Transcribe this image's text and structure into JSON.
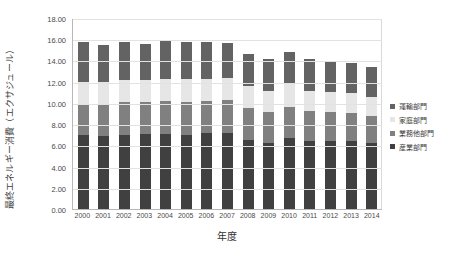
{
  "chart_data": {
    "type": "bar",
    "subtype": "stacked-column",
    "title": "",
    "xlabel": "年度",
    "ylabel": "最終エネルギー消費（エクサジュール）",
    "ylim": [
      0,
      18
    ],
    "ytick_step": 2,
    "grid": true,
    "legend_position": "right",
    "categories": [
      "2000",
      "2001",
      "2002",
      "2003",
      "2004",
      "2005",
      "2006",
      "2007",
      "2008",
      "2009",
      "2010",
      "2011",
      "2012",
      "2013",
      "2014"
    ],
    "ytick_labels": [
      "0.00",
      "2.00",
      "4.00",
      "6.00",
      "8.00",
      "10.00",
      "12.00",
      "14.00",
      "16.00",
      "18.00"
    ],
    "series": [
      {
        "name": "産業部門",
        "color": "#404040",
        "stack_order": 1,
        "values": [
          6.95,
          6.85,
          7.0,
          7.05,
          7.1,
          7.0,
          7.2,
          7.2,
          6.55,
          6.25,
          6.7,
          6.45,
          6.4,
          6.45,
          6.25
        ]
      },
      {
        "name": "業務他部門",
        "color": "#808080",
        "stack_order": 2,
        "values": [
          2.95,
          3.0,
          3.05,
          3.0,
          3.05,
          3.1,
          3.0,
          3.05,
          2.95,
          2.85,
          2.95,
          2.75,
          2.7,
          2.6,
          2.5
        ]
      },
      {
        "name": "家庭部門",
        "color": "#e6e6e6",
        "stack_order": 3,
        "values": [
          2.1,
          2.1,
          2.15,
          2.1,
          2.1,
          2.2,
          2.05,
          2.1,
          2.05,
          2.05,
          2.15,
          1.95,
          1.95,
          1.9,
          1.8
        ]
      },
      {
        "name": "運輸部門",
        "color": "#636363",
        "stack_order": 4,
        "values": [
          3.7,
          3.55,
          3.5,
          3.45,
          3.6,
          3.45,
          3.5,
          3.25,
          3.1,
          3.0,
          3.0,
          2.95,
          2.9,
          2.85,
          2.8
        ]
      }
    ],
    "totals": [
      15.7,
      15.5,
      15.7,
      15.6,
      15.85,
      15.75,
      15.75,
      15.6,
      14.65,
      14.15,
      14.8,
      14.1,
      13.95,
      13.8,
      13.35
    ]
  },
  "legend": {
    "items": [
      {
        "label": "運輸部門",
        "color": "#636363"
      },
      {
        "label": "家庭部門",
        "color": "#e6e6e6"
      },
      {
        "label": "業務他部門",
        "color": "#808080"
      },
      {
        "label": "産業部門",
        "color": "#404040"
      }
    ]
  }
}
